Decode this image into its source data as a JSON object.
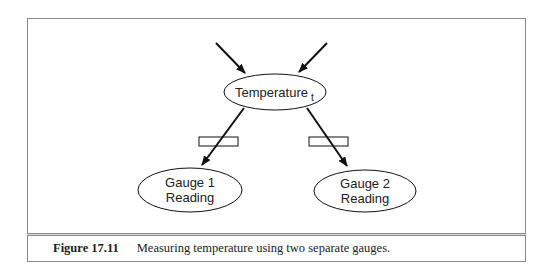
{
  "diagram": {
    "nodes": [
      {
        "id": "temperature",
        "label": "Temperature",
        "subscript": "t"
      },
      {
        "id": "gauge1",
        "label_line1": "Gauge 1",
        "label_line2": "Reading"
      },
      {
        "id": "gauge2",
        "label_line1": "Gauge 2",
        "label_line2": "Reading"
      }
    ],
    "edges": [
      {
        "from": "external-left",
        "to": "temperature"
      },
      {
        "from": "external-right",
        "to": "temperature"
      },
      {
        "from": "temperature",
        "to": "gauge1",
        "annotation": "empty-box"
      },
      {
        "from": "temperature",
        "to": "gauge2",
        "annotation": "empty-box"
      }
    ],
    "colors": {
      "stroke": "#111111",
      "frame": "#8a8a8a"
    }
  },
  "caption": {
    "figure_number": "Figure 17.11",
    "text": "Measuring temperature using two separate gauges."
  }
}
